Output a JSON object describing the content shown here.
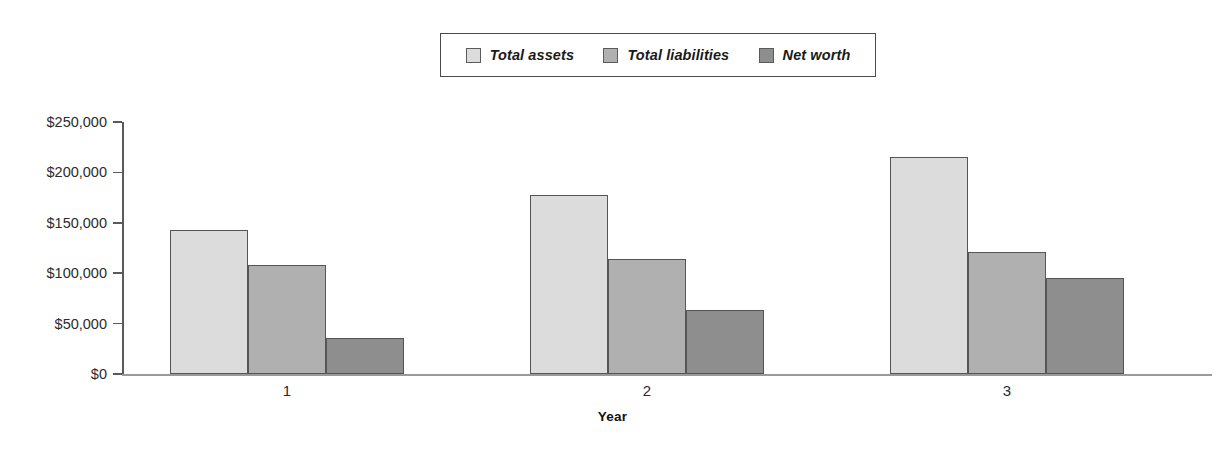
{
  "chart_data": {
    "type": "bar",
    "title": "",
    "xlabel": "Year",
    "ylabel": "",
    "categories": [
      "1",
      "2",
      "3"
    ],
    "series": [
      {
        "name": "Total assets",
        "values": [
          143000,
          178000,
          215000
        ],
        "color": "#dcdcdc"
      },
      {
        "name": "Total liabilities",
        "values": [
          108000,
          114000,
          121000
        ],
        "color": "#b0b0b0"
      },
      {
        "name": "Net worth",
        "values": [
          36000,
          64000,
          95000
        ],
        "color": "#8e8e8e"
      }
    ],
    "ylim": [
      0,
      250000
    ],
    "ytick_labels": [
      "$250,000",
      "$200,000",
      "$150,000",
      "$100,000",
      "$50,000",
      "$0"
    ],
    "ytick_values": [
      250000,
      200000,
      150000,
      100000,
      50000,
      0
    ],
    "grid": false,
    "legend_position": "top-center",
    "legend_entries": [
      "Total assets",
      "Total liabilities",
      "Net worth"
    ]
  },
  "legend": {
    "items": [
      {
        "label": "Total assets"
      },
      {
        "label": "Total liabilities"
      },
      {
        "label": "Net worth"
      }
    ]
  },
  "axes": {
    "x_title": "Year",
    "y_labels": [
      "$250,000",
      "$200,000",
      "$150,000",
      "$100,000",
      "$50,000",
      "$0"
    ],
    "x_labels": [
      "1",
      "2",
      "3"
    ]
  }
}
